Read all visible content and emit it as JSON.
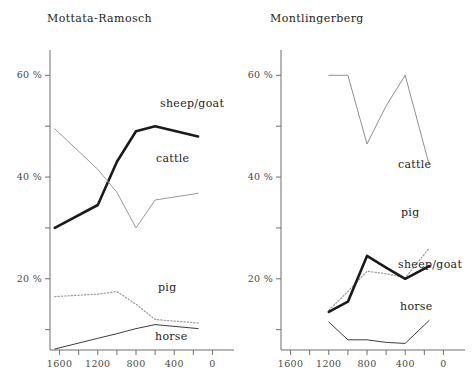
{
  "figure": {
    "background": "#ffffff",
    "axis_color": "#6f6f6f"
  },
  "chart_data": [
    {
      "type": "line",
      "title": "Mottata-Ramosch",
      "xlabel": "",
      "ylabel": "",
      "xlim": [
        1700,
        -100
      ],
      "ylim": [
        6,
        64
      ],
      "x_reversed": true,
      "grid": false,
      "legend": "inline-labels",
      "x_ticks": [
        1600,
        1400,
        1200,
        1000,
        800,
        600,
        400,
        200,
        0
      ],
      "x_tick_labels": [
        "1600",
        "",
        "1200",
        "",
        "800",
        "",
        "400",
        "",
        "0"
      ],
      "y_ticks": [
        10,
        20,
        30,
        40,
        50,
        60
      ],
      "y_tick_labels": [
        "",
        "20 %",
        "",
        "40 %",
        "",
        "60 %"
      ],
      "series": [
        {
          "name": "sheep/goat",
          "style": "thick-solid",
          "color": "#1a1a1a",
          "width": 2.6,
          "x": [
            1650,
            1200,
            1000,
            800,
            600,
            150
          ],
          "values": [
            30.0,
            34.5,
            43.0,
            49.0,
            50.0,
            48.0
          ]
        },
        {
          "name": "cattle",
          "style": "thin-solid",
          "color": "#9a9a9a",
          "width": 1.0,
          "x": [
            1650,
            1200,
            1000,
            800,
            600,
            150
          ],
          "values": [
            49.5,
            41.5,
            37.0,
            30.0,
            35.5,
            36.8
          ]
        },
        {
          "name": "pig",
          "style": "dotted",
          "color": "#9a9a9a",
          "width": 1.2,
          "x": [
            1650,
            1200,
            1000,
            800,
            600,
            150
          ],
          "values": [
            16.5,
            17.0,
            17.5,
            15.0,
            12.0,
            11.3
          ]
        },
        {
          "name": "horse",
          "style": "thin-solid",
          "color": "#3d3d3d",
          "width": 1.0,
          "x": [
            1650,
            1200,
            1000,
            800,
            600,
            150
          ],
          "values": [
            6.2,
            8.3,
            9.2,
            10.2,
            11.0,
            10.2
          ]
        }
      ],
      "series_label_positions": [
        {
          "name": "sheep/goat",
          "x_px": 160,
          "y_px": 97
        },
        {
          "name": "cattle",
          "x_px": 156,
          "y_px": 152
        },
        {
          "name": "pig",
          "x_px": 158,
          "y_px": 281
        },
        {
          "name": "horse",
          "x_px": 155,
          "y_px": 330
        }
      ]
    },
    {
      "type": "line",
      "title": "Montlingerberg",
      "xlabel": "",
      "ylabel": "",
      "xlim": [
        1700,
        -100
      ],
      "ylim": [
        6,
        64
      ],
      "x_reversed": true,
      "grid": false,
      "legend": "inline-labels",
      "x_ticks": [
        1600,
        1400,
        1200,
        1000,
        800,
        600,
        400,
        200,
        0
      ],
      "x_tick_labels": [
        "1600",
        "",
        "1200",
        "",
        "800",
        "",
        "400",
        "",
        "0"
      ],
      "y_ticks": [
        10,
        20,
        30,
        40,
        50,
        60
      ],
      "y_tick_labels": [
        "",
        "20 %",
        "",
        "40 %",
        "",
        "60 %"
      ],
      "series": [
        {
          "name": "cattle",
          "style": "thin-solid",
          "color": "#8f8f8f",
          "width": 1.0,
          "x": [
            1200,
            1000,
            800,
            600,
            400,
            150
          ],
          "values": [
            60.0,
            60.0,
            46.5,
            54.0,
            60.0,
            42.5
          ]
        },
        {
          "name": "pig",
          "style": "dotted",
          "color": "#9a9a9a",
          "width": 1.2,
          "x": [
            1200,
            1000,
            800,
            600,
            400,
            150
          ],
          "values": [
            13.8,
            17.5,
            21.5,
            21.0,
            20.2,
            26.0
          ]
        },
        {
          "name": "sheep/goat",
          "style": "thick-solid",
          "color": "#1a1a1a",
          "width": 2.6,
          "x": [
            1200,
            1000,
            800,
            600,
            400,
            150
          ],
          "values": [
            13.5,
            15.5,
            24.5,
            22.2,
            20.0,
            22.5
          ]
        },
        {
          "name": "horse",
          "style": "thin-solid",
          "color": "#3d3d3d",
          "width": 1.0,
          "x": [
            1200,
            1000,
            800,
            600,
            400,
            150
          ],
          "values": [
            11.5,
            8.0,
            8.0,
            7.5,
            7.3,
            11.8
          ]
        }
      ],
      "series_label_positions": [
        {
          "name": "cattle",
          "x_px": 160,
          "y_px": 158
        },
        {
          "name": "pig",
          "x_px": 163,
          "y_px": 206
        },
        {
          "name": "sheep/goat",
          "x_px": 160,
          "y_px": 258
        },
        {
          "name": "horse",
          "x_px": 162,
          "y_px": 300
        }
      ]
    }
  ]
}
